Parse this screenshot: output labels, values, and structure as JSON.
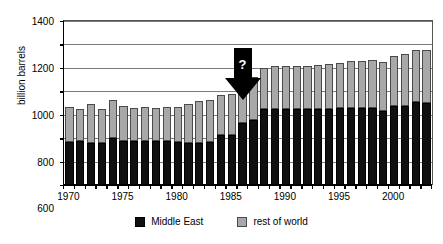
{
  "chart_data": {
    "type": "bar",
    "subtype": "stacked",
    "title": "",
    "xlabel": "",
    "ylabel": "billion barrels",
    "ylim": [
      0,
      1400
    ],
    "ytick_step": 200,
    "yticks": [
      0,
      200,
      400,
      600,
      800,
      1000,
      1200,
      1400
    ],
    "ytick_labels": [
      "0",
      "200",
      "400",
      "600",
      "800",
      "1000",
      "1200",
      "1400"
    ],
    "grid": true,
    "grid_axis": "y",
    "legend_position": "bottom-center",
    "x": [
      1970,
      1971,
      1972,
      1973,
      1974,
      1975,
      1976,
      1977,
      1978,
      1979,
      1980,
      1981,
      1982,
      1983,
      1984,
      1985,
      1986,
      1987,
      1988,
      1989,
      1990,
      1991,
      1992,
      1993,
      1994,
      1995,
      1996,
      1997,
      1998,
      1999,
      2000,
      2001,
      2002,
      2003
    ],
    "xtick_labels": [
      "1970",
      "1975",
      "1980",
      "1985",
      "1990",
      "1995",
      "2000"
    ],
    "xticks": [
      1970,
      1975,
      1980,
      1985,
      1990,
      1995,
      2000
    ],
    "series": [
      {
        "name": "Middle East",
        "color": "#101010",
        "values": [
          370,
          372,
          362,
          355,
          405,
          375,
          372,
          375,
          373,
          372,
          370,
          360,
          360,
          370,
          425,
          428,
          530,
          555,
          645,
          650,
          650,
          650,
          650,
          650,
          650,
          655,
          660,
          660,
          660,
          630,
          675,
          678,
          705,
          700
        ]
      },
      {
        "name": "rest of world",
        "color": "#a8a8a8",
        "values": [
          300,
          280,
          328,
          290,
          325,
          297,
          288,
          295,
          288,
          295,
          300,
          328,
          355,
          355,
          340,
          348,
          355,
          365,
          358,
          370,
          368,
          368,
          368,
          378,
          385,
          385,
          400,
          395,
          410,
          420,
          430,
          440,
          445,
          450
        ]
      }
    ],
    "totals": [
      670,
      652,
      690,
      645,
      730,
      672,
      660,
      670,
      661,
      667,
      670,
      688,
      715,
      725,
      765,
      776,
      885,
      920,
      1003,
      1020,
      1018,
      1018,
      1018,
      1028,
      1035,
      1040,
      1060,
      1055,
      1070,
      1050,
      1105,
      1118,
      1150,
      1150
    ],
    "annotations": [
      {
        "name": "down-arrow-question",
        "label": "?",
        "x": 1986,
        "points_to": "1986-1987 jump in reserves"
      }
    ]
  },
  "legend": {
    "entries": [
      {
        "label": "Middle East",
        "swatch": "black-square-icon"
      },
      {
        "label": "rest of world",
        "swatch": "gray-square-icon"
      }
    ]
  }
}
